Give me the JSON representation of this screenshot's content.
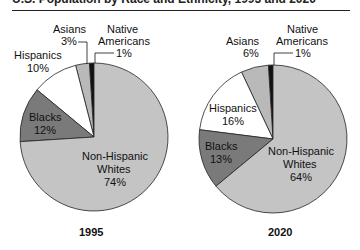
{
  "title": "U.S. Population by Race and Ethnicity, 1995 and 2020",
  "chart_data": [
    {
      "type": "pie",
      "title": "1995",
      "categories": [
        "Native Americans",
        "Asians",
        "Hispanics",
        "Blacks",
        "Non-Hispanic Whites"
      ],
      "values": [
        1,
        3,
        10,
        12,
        74
      ],
      "unit": "%",
      "colors": [
        "#111111",
        "#b9b9b9",
        "#ffffff",
        "#7a7a7a",
        "#c4c4c4"
      ]
    },
    {
      "type": "pie",
      "title": "2020",
      "categories": [
        "Native Americans",
        "Asians",
        "Hispanics",
        "Blacks",
        "Non-Hispanic Whites"
      ],
      "values": [
        1,
        6,
        16,
        13,
        64
      ],
      "unit": "%",
      "colors": [
        "#111111",
        "#b9b9b9",
        "#ffffff",
        "#7a7a7a",
        "#c4c4c4"
      ]
    }
  ],
  "labels": {
    "p1": {
      "native_line1": "Native",
      "native_line2": "Americans",
      "native_pct": "1%",
      "asians": "Asians",
      "asians_pct": "3%",
      "hispanics": "Hispanics",
      "hispanics_pct": "10%",
      "blacks": "Blacks",
      "blacks_pct": "12%",
      "whites_line1": "Non-Hispanic",
      "whites_line2": "Whites",
      "whites_pct": "74%",
      "year": "1995"
    },
    "p2": {
      "native_line1": "Native",
      "native_line2": "Americans",
      "native_pct": "1%",
      "asians": "Asians",
      "asians_pct": "6%",
      "hispanics": "Hispanics",
      "hispanics_pct": "16%",
      "blacks": "Blacks",
      "blacks_pct": "13%",
      "whites_line1": "Non-Hispanic",
      "whites_line2": "Whites",
      "whites_pct": "64%",
      "year": "2020"
    }
  }
}
